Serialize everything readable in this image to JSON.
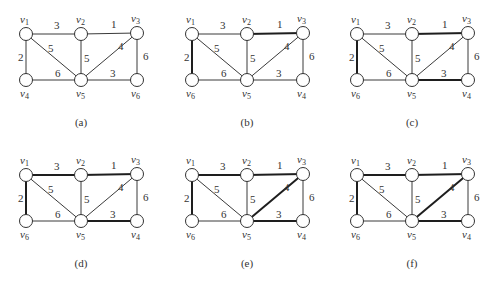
{
  "figure": {
    "panels": [
      {
        "caption": "(a)",
        "vertex_labels": {
          "tl": "v1",
          "tm": "v2",
          "tr": "v3",
          "bl": "v4",
          "bm": "v5",
          "br": "v6"
        },
        "bold_edges": []
      },
      {
        "caption": "(b)",
        "vertex_labels": {
          "tl": "v1",
          "tm": "v2",
          "tr": "v3",
          "bl": "v6",
          "bm": "v5",
          "br": "v4"
        },
        "bold_edges": [
          "tm-tr",
          "tl-bl"
        ]
      },
      {
        "caption": "(c)",
        "vertex_labels": {
          "tl": "v1",
          "tm": "v2",
          "tr": "v3",
          "bl": "v6",
          "bm": "v5",
          "br": "v4"
        },
        "bold_edges": [
          "tm-tr",
          "tl-bl",
          "bm-br"
        ]
      },
      {
        "caption": "(d)",
        "vertex_labels": {
          "tl": "v1",
          "tm": "v2",
          "tr": "v3",
          "bl": "v6",
          "bm": "v5",
          "br": "v4"
        },
        "bold_edges": [
          "tm-tr",
          "tl-bl",
          "bm-br",
          "tl-tm"
        ]
      },
      {
        "caption": "(e)",
        "vertex_labels": {
          "tl": "v1",
          "tm": "v2",
          "tr": "v3",
          "bl": "v6",
          "bm": "v5",
          "br": "v4"
        },
        "bold_edges": [
          "tm-tr",
          "tl-bl",
          "bm-br",
          "tl-tm",
          "tr-bm"
        ]
      },
      {
        "caption": "(f)",
        "vertex_labels": {
          "tl": "v1",
          "tm": "v2",
          "tr": "v3",
          "bl": "v6",
          "bm": "v5",
          "br": "v4"
        },
        "bold_edges": [
          "tm-tr",
          "tl-bl",
          "bm-br",
          "tl-tm",
          "tr-bm"
        ]
      }
    ],
    "edges": [
      {
        "id": "tl-tm",
        "from": "tl",
        "to": "tm",
        "weight": "3"
      },
      {
        "id": "tm-tr",
        "from": "tm",
        "to": "tr",
        "weight": "1"
      },
      {
        "id": "tl-bl",
        "from": "tl",
        "to": "bl",
        "weight": "2"
      },
      {
        "id": "tl-bm",
        "from": "tl",
        "to": "bm",
        "weight": "5"
      },
      {
        "id": "tm-bm",
        "from": "tm",
        "to": "bm",
        "weight": "5"
      },
      {
        "id": "tr-bm",
        "from": "tr",
        "to": "bm",
        "weight": "4"
      },
      {
        "id": "tr-br",
        "from": "tr",
        "to": "br",
        "weight": "6"
      },
      {
        "id": "bl-bm",
        "from": "bl",
        "to": "bm",
        "weight": "6"
      },
      {
        "id": "bm-br",
        "from": "bm",
        "to": "br",
        "weight": "3"
      }
    ]
  }
}
